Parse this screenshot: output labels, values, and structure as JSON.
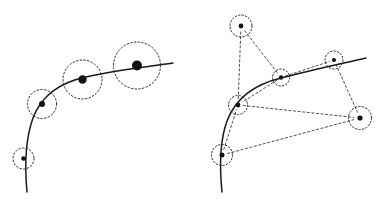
{
  "figure": {
    "title": "",
    "caption": "",
    "background_color": "#ffffff",
    "width": 386,
    "height": 199,
    "curve_color": "#1a1a1a",
    "dashed_color": "#2b2b2b",
    "dot_color": "#111111",
    "edge_color": "#3a3a3a"
  },
  "panels": [
    {
      "id": "left-panel",
      "name": "multi-scale-feature-points",
      "label": "",
      "curve": {
        "name": "contour-curve",
        "path": "M 27 192 C 25 170 25 140 33 118 C 42 94 62 82 86 77 C 112 71 145 67 173 63",
        "stroke_width": 1.5
      },
      "features": [
        {
          "name": "feature-point-1",
          "cx": 23.5,
          "cy": 158.5,
          "scale_radius": 10.5,
          "dot_radius": 2.3
        },
        {
          "name": "feature-point-2",
          "cx": 42.0,
          "cy": 104.0,
          "scale_radius": 14.5,
          "dot_radius": 3.0
        },
        {
          "name": "feature-point-3",
          "cx": 82.5,
          "cy": 79.5,
          "scale_radius": 19.5,
          "dot_radius": 4.2
        },
        {
          "name": "feature-point-4",
          "cx": 137.0,
          "cy": 65.5,
          "scale_radius": 23.5,
          "dot_radius": 5.0
        }
      ]
    },
    {
      "id": "right-panel",
      "name": "feature-graph",
      "label": "",
      "curve": {
        "name": "contour-curve",
        "path": "M 222 192 C 220 172 219 143 227 121 C 236 97 256 84 281 78 C 307 71 340 64 366 58",
        "stroke_width": 1.5
      },
      "nodes": [
        {
          "id": "n1",
          "name": "graph-node-top-left",
          "cx": 241.0,
          "cy": 26.0,
          "radius": 11.0,
          "dot_radius": 2.4
        },
        {
          "id": "n2",
          "name": "graph-node-mid-curve",
          "cx": 281.0,
          "cy": 77.5,
          "radius": 8.5,
          "dot_radius": 2.2
        },
        {
          "id": "n3",
          "name": "graph-node-top-right",
          "cx": 334.0,
          "cy": 60.0,
          "radius": 9.0,
          "dot_radius": 2.0
        },
        {
          "id": "n4",
          "name": "graph-node-right",
          "cx": 360.0,
          "cy": 118.0,
          "radius": 11.5,
          "dot_radius": 2.6
        },
        {
          "id": "n5",
          "name": "graph-node-left-mid",
          "cx": 238.0,
          "cy": 105.0,
          "radius": 9.5,
          "dot_radius": 2.4
        },
        {
          "id": "n6",
          "name": "graph-node-bottom-left",
          "cx": 222.0,
          "cy": 155.0,
          "radius": 10.5,
          "dot_radius": 2.5
        }
      ],
      "edges": [
        {
          "name": "graph-edge-n1-n5",
          "from": "n1",
          "to": "n5"
        },
        {
          "name": "graph-edge-n1-n2",
          "from": "n1",
          "to": "n2"
        },
        {
          "name": "graph-edge-n2-n5",
          "from": "n2",
          "to": "n5"
        },
        {
          "name": "graph-edge-n2-n3",
          "from": "n2",
          "to": "n3"
        },
        {
          "name": "graph-edge-n3-n4",
          "from": "n3",
          "to": "n4"
        },
        {
          "name": "graph-edge-n5-n4",
          "from": "n5",
          "to": "n4"
        },
        {
          "name": "graph-edge-n6-n5",
          "from": "n6",
          "to": "n5"
        },
        {
          "name": "graph-edge-n6-n4",
          "from": "n6",
          "to": "n4"
        }
      ]
    }
  ]
}
